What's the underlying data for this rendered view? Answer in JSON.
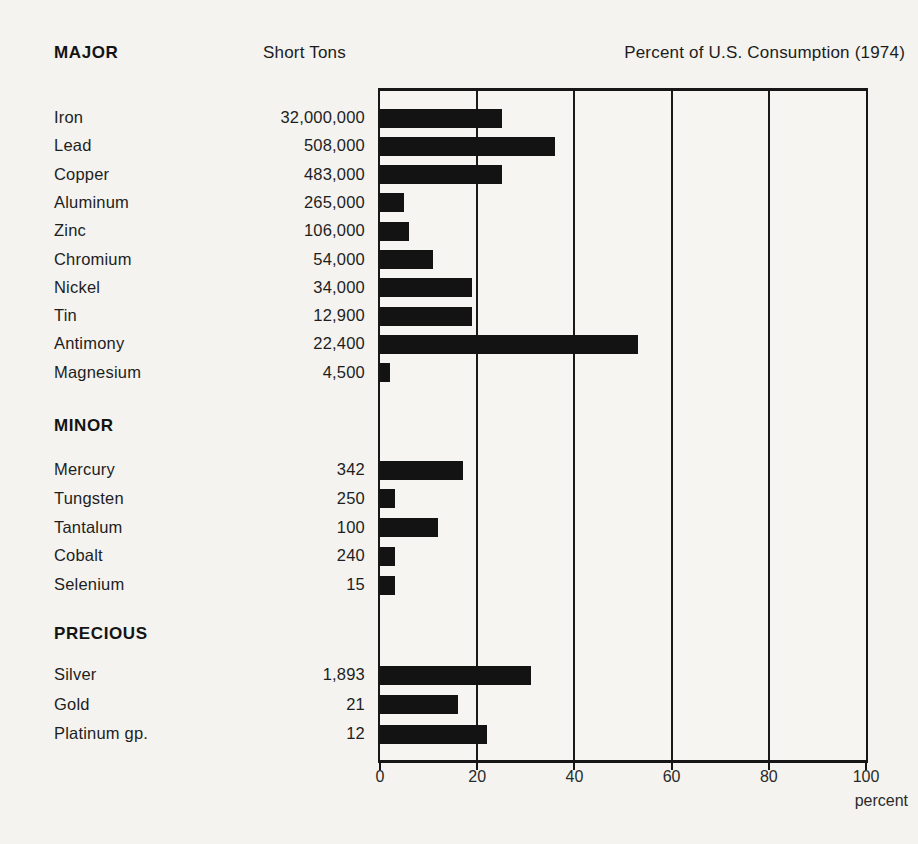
{
  "header": {
    "short_tons": "Short Tons",
    "percent_title": "Percent of U.S. Consumption (1974)"
  },
  "axis": {
    "ticks": [
      "0",
      "20",
      "40",
      "60",
      "80",
      "100"
    ],
    "unit_label": "percent"
  },
  "groups": [
    {
      "label": "MAJOR",
      "items": [
        {
          "name": "Iron",
          "tons": "32,000,000",
          "percent": 25
        },
        {
          "name": "Lead",
          "tons": "508,000",
          "percent": 36
        },
        {
          "name": "Copper",
          "tons": "483,000",
          "percent": 25
        },
        {
          "name": "Aluminum",
          "tons": "265,000",
          "percent": 5
        },
        {
          "name": "Zinc",
          "tons": "106,000",
          "percent": 6
        },
        {
          "name": "Chromium",
          "tons": "54,000",
          "percent": 11
        },
        {
          "name": "Nickel",
          "tons": "34,000",
          "percent": 19
        },
        {
          "name": "Tin",
          "tons": "12,900",
          "percent": 19
        },
        {
          "name": "Antimony",
          "tons": "22,400",
          "percent": 53
        },
        {
          "name": "Magnesium",
          "tons": "4,500",
          "percent": 2
        }
      ]
    },
    {
      "label": "MINOR",
      "items": [
        {
          "name": "Mercury",
          "tons": "342",
          "percent": 17
        },
        {
          "name": "Tungsten",
          "tons": "250",
          "percent": 3
        },
        {
          "name": "Tantalum",
          "tons": "100",
          "percent": 12
        },
        {
          "name": "Cobalt",
          "tons": "240",
          "percent": 3
        },
        {
          "name": "Selenium",
          "tons": "15",
          "percent": 3
        }
      ]
    },
    {
      "label": "PRECIOUS",
      "items": [
        {
          "name": "Silver",
          "tons": "1,893",
          "percent": 31
        },
        {
          "name": "Gold",
          "tons": "21",
          "percent": 16
        },
        {
          "name": "Platinum gp.",
          "tons": "12",
          "percent": 22
        }
      ]
    }
  ],
  "chart_data": {
    "type": "bar",
    "orientation": "horizontal",
    "title": "Percent of U.S. Consumption (1974)",
    "secondary_column_header": "Short Tons",
    "categories": [
      "Iron",
      "Lead",
      "Copper",
      "Aluminum",
      "Zinc",
      "Chromium",
      "Nickel",
      "Tin",
      "Antimony",
      "Magnesium",
      "Mercury",
      "Tungsten",
      "Tantalum",
      "Cobalt",
      "Selenium",
      "Silver",
      "Gold",
      "Platinum gp."
    ],
    "values": [
      25,
      36,
      25,
      5,
      6,
      11,
      19,
      19,
      53,
      2,
      17,
      3,
      12,
      3,
      3,
      31,
      16,
      22
    ],
    "short_tons": [
      "32,000,000",
      "508,000",
      "483,000",
      "265,000",
      "106,000",
      "54,000",
      "34,000",
      "12,900",
      "22,400",
      "4,500",
      "342",
      "250",
      "100",
      "240",
      "15",
      "1,893",
      "21",
      "12"
    ],
    "group_labels": [
      "MAJOR",
      "MINOR",
      "PRECIOUS"
    ],
    "group_of": [
      "MAJOR",
      "MAJOR",
      "MAJOR",
      "MAJOR",
      "MAJOR",
      "MAJOR",
      "MAJOR",
      "MAJOR",
      "MAJOR",
      "MAJOR",
      "MINOR",
      "MINOR",
      "MINOR",
      "MINOR",
      "MINOR",
      "PRECIOUS",
      "PRECIOUS",
      "PRECIOUS"
    ],
    "xlabel": "percent",
    "xlim": [
      0,
      100
    ],
    "xticks": [
      0,
      20,
      40,
      60,
      80,
      100
    ],
    "grid": true,
    "bar_color": "#131313",
    "background_color": "#f4f3ef"
  }
}
